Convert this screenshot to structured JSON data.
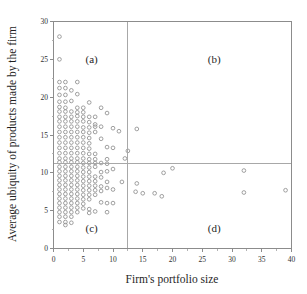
{
  "chart_data": {
    "type": "scatter",
    "title": "",
    "xlabel": "Firm's portfolio size",
    "ylabel": "Average ubiquity of products made by the firm",
    "xlim": [
      0,
      40
    ],
    "ylim": [
      0,
      30
    ],
    "xticks": [
      0,
      5,
      10,
      15,
      20,
      25,
      30,
      35,
      40
    ],
    "yticks": [
      0,
      5,
      10,
      15,
      20,
      25,
      30
    ],
    "xtick_labels": [
      "0",
      "5",
      "10",
      "15",
      "20",
      "25",
      "30",
      "35",
      "40"
    ],
    "ytick_labels": [
      "0",
      "5",
      "10",
      "15",
      "20",
      "25",
      "30"
    ],
    "grid": false,
    "legend": null,
    "minor_ticks": true,
    "marker_style": "open-circle",
    "marker_color": "#8f8f8f",
    "frame_color": "#8c8c8c",
    "divider_color": "#a8a8a8",
    "reference_lines": {
      "vertical_x": 12.5,
      "horizontal_y": 11.3
    },
    "quadrant_labels": [
      {
        "key": "a",
        "text": "(a)",
        "x": 6.4,
        "y": 24.5
      },
      {
        "key": "b",
        "text": "(b)",
        "x": 27.0,
        "y": 24.5
      },
      {
        "key": "c",
        "text": "(c)",
        "x": 6.4,
        "y": 2.2
      },
      {
        "key": "d",
        "text": "(d)",
        "x": 27.0,
        "y": 2.2
      }
    ],
    "points": [
      [
        1.0,
        28.0
      ],
      [
        1.0,
        25.0
      ],
      [
        1.0,
        22.0
      ],
      [
        2.0,
        22.0
      ],
      [
        4.0,
        22.0
      ],
      [
        1.0,
        21.2
      ],
      [
        2.0,
        21.2
      ],
      [
        3.0,
        20.9
      ],
      [
        1.0,
        20.3
      ],
      [
        2.0,
        20.3
      ],
      [
        4.0,
        20.4
      ],
      [
        1.0,
        19.4
      ],
      [
        2.0,
        19.4
      ],
      [
        3.0,
        19.5
      ],
      [
        6.0,
        19.3
      ],
      [
        1.0,
        18.7
      ],
      [
        2.0,
        18.6
      ],
      [
        4.0,
        18.6
      ],
      [
        5.0,
        18.6
      ],
      [
        8.0,
        18.6
      ],
      [
        1.0,
        18.1
      ],
      [
        2.0,
        18.1
      ],
      [
        3.0,
        18.1
      ],
      [
        4.0,
        18.0
      ],
      [
        5.0,
        18.0
      ],
      [
        9.0,
        17.9
      ],
      [
        1.0,
        17.4
      ],
      [
        2.0,
        17.4
      ],
      [
        3.0,
        17.4
      ],
      [
        4.0,
        17.5
      ],
      [
        5.0,
        17.4
      ],
      [
        6.0,
        17.4
      ],
      [
        7.0,
        17.4
      ],
      [
        1.0,
        16.8
      ],
      [
        2.0,
        16.8
      ],
      [
        3.0,
        16.8
      ],
      [
        4.0,
        16.8
      ],
      [
        5.0,
        16.8
      ],
      [
        6.0,
        16.7
      ],
      [
        7.0,
        16.4
      ],
      [
        1.0,
        16.1
      ],
      [
        2.0,
        16.1
      ],
      [
        3.0,
        16.1
      ],
      [
        4.0,
        16.1
      ],
      [
        5.0,
        16.0
      ],
      [
        6.0,
        16.0
      ],
      [
        7.0,
        16.1
      ],
      [
        8.0,
        16.1
      ],
      [
        10.0,
        15.9
      ],
      [
        14.0,
        15.8
      ],
      [
        1.0,
        15.4
      ],
      [
        2.0,
        15.4
      ],
      [
        3.0,
        15.4
      ],
      [
        4.0,
        15.4
      ],
      [
        5.0,
        15.4
      ],
      [
        6.0,
        15.3
      ],
      [
        7.0,
        15.4
      ],
      [
        11.0,
        15.5
      ],
      [
        1.0,
        14.7
      ],
      [
        2.0,
        14.7
      ],
      [
        3.0,
        14.7
      ],
      [
        4.0,
        14.7
      ],
      [
        5.0,
        14.7
      ],
      [
        6.0,
        14.6
      ],
      [
        8.0,
        14.5
      ],
      [
        1.0,
        14.0
      ],
      [
        2.0,
        14.0
      ],
      [
        3.0,
        14.0
      ],
      [
        4.0,
        14.0
      ],
      [
        5.0,
        14.0
      ],
      [
        6.0,
        13.9
      ],
      [
        9.0,
        13.4
      ],
      [
        1.0,
        13.3
      ],
      [
        2.0,
        13.3
      ],
      [
        3.0,
        13.3
      ],
      [
        4.0,
        13.3
      ],
      [
        5.0,
        13.3
      ],
      [
        6.0,
        13.2
      ],
      [
        10.0,
        13.3
      ],
      [
        12.5,
        12.9
      ],
      [
        1.0,
        12.6
      ],
      [
        2.0,
        12.6
      ],
      [
        3.0,
        12.6
      ],
      [
        4.0,
        12.6
      ],
      [
        5.0,
        12.6
      ],
      [
        6.0,
        12.5
      ],
      [
        7.0,
        12.5
      ],
      [
        1.0,
        11.9
      ],
      [
        2.0,
        11.9
      ],
      [
        3.0,
        11.9
      ],
      [
        4.0,
        11.9
      ],
      [
        5.0,
        11.9
      ],
      [
        6.0,
        11.8
      ],
      [
        7.0,
        11.8
      ],
      [
        9.0,
        11.8
      ],
      [
        12.0,
        11.9
      ],
      [
        1.0,
        11.4
      ],
      [
        2.0,
        11.4
      ],
      [
        3.0,
        11.4
      ],
      [
        4.0,
        11.4
      ],
      [
        5.0,
        11.3
      ],
      [
        6.0,
        11.3
      ],
      [
        7.0,
        11.3
      ],
      [
        8.0,
        11.3
      ],
      [
        9.0,
        11.2
      ],
      [
        1.0,
        10.8
      ],
      [
        2.0,
        10.8
      ],
      [
        3.0,
        10.8
      ],
      [
        4.0,
        10.8
      ],
      [
        5.0,
        10.7
      ],
      [
        6.0,
        10.7
      ],
      [
        7.0,
        10.8
      ],
      [
        10.0,
        10.5
      ],
      [
        1.0,
        10.2
      ],
      [
        2.0,
        10.2
      ],
      [
        3.0,
        10.2
      ],
      [
        4.0,
        10.2
      ],
      [
        5.0,
        10.1
      ],
      [
        6.0,
        10.1
      ],
      [
        8.0,
        10.1
      ],
      [
        9.0,
        10.2
      ],
      [
        1.0,
        9.6
      ],
      [
        2.0,
        9.6
      ],
      [
        3.0,
        9.6
      ],
      [
        4.0,
        9.6
      ],
      [
        5.0,
        9.5
      ],
      [
        6.0,
        9.5
      ],
      [
        7.0,
        9.5
      ],
      [
        8.0,
        9.4
      ],
      [
        1.0,
        9.0
      ],
      [
        2.0,
        9.0
      ],
      [
        3.0,
        9.0
      ],
      [
        4.0,
        9.0
      ],
      [
        5.0,
        8.9
      ],
      [
        6.0,
        8.9
      ],
      [
        7.0,
        8.9
      ],
      [
        9.0,
        8.8
      ],
      [
        11.5,
        8.8
      ],
      [
        1.0,
        8.4
      ],
      [
        2.0,
        8.4
      ],
      [
        3.0,
        8.4
      ],
      [
        4.0,
        8.4
      ],
      [
        5.0,
        8.3
      ],
      [
        6.0,
        8.3
      ],
      [
        7.0,
        8.3
      ],
      [
        8.0,
        8.2
      ],
      [
        9.0,
        8.0
      ],
      [
        14.0,
        8.6
      ],
      [
        1.0,
        7.8
      ],
      [
        2.0,
        7.8
      ],
      [
        3.0,
        7.8
      ],
      [
        4.0,
        7.8
      ],
      [
        5.0,
        7.7
      ],
      [
        6.0,
        7.7
      ],
      [
        7.0,
        7.7
      ],
      [
        8.0,
        7.6
      ],
      [
        10.0,
        7.8
      ],
      [
        13.8,
        7.5
      ],
      [
        15.0,
        7.3
      ],
      [
        17.0,
        7.3
      ],
      [
        18.2,
        6.9
      ],
      [
        32.0,
        7.4
      ],
      [
        39.0,
        7.7
      ],
      [
        1.0,
        7.2
      ],
      [
        2.0,
        7.2
      ],
      [
        3.0,
        7.2
      ],
      [
        4.0,
        7.2
      ],
      [
        5.0,
        7.1
      ],
      [
        6.0,
        7.1
      ],
      [
        7.0,
        7.1
      ],
      [
        1.0,
        6.6
      ],
      [
        2.0,
        6.6
      ],
      [
        3.0,
        6.6
      ],
      [
        4.0,
        6.6
      ],
      [
        5.0,
        6.5
      ],
      [
        6.0,
        6.5
      ],
      [
        9.0,
        6.0
      ],
      [
        10.0,
        6.0
      ],
      [
        1.0,
        6.0
      ],
      [
        2.0,
        6.0
      ],
      [
        3.0,
        6.0
      ],
      [
        4.0,
        6.0
      ],
      [
        5.0,
        5.9
      ],
      [
        8.0,
        6.1
      ],
      [
        1.0,
        5.4
      ],
      [
        2.0,
        5.4
      ],
      [
        3.0,
        5.4
      ],
      [
        4.0,
        5.4
      ],
      [
        5.0,
        5.3
      ],
      [
        6.0,
        5.2
      ],
      [
        1.0,
        4.8
      ],
      [
        2.0,
        4.8
      ],
      [
        3.0,
        4.8
      ],
      [
        4.0,
        4.8
      ],
      [
        6.0,
        4.7
      ],
      [
        7.0,
        4.9
      ],
      [
        9.0,
        4.8
      ],
      [
        1.0,
        4.2
      ],
      [
        2.0,
        4.2
      ],
      [
        3.0,
        4.2
      ],
      [
        1.0,
        3.5
      ],
      [
        2.0,
        3.5
      ],
      [
        3.0,
        3.4
      ],
      [
        2.0,
        3.1
      ],
      [
        18.5,
        10.0
      ],
      [
        20.0,
        10.6
      ],
      [
        32.0,
        10.3
      ]
    ]
  }
}
